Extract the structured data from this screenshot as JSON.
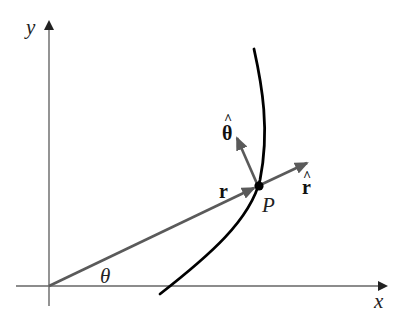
{
  "diagram": {
    "labels": {
      "y_axis": "y",
      "x_axis": "x",
      "angle": "θ",
      "position_vector": "r",
      "point": "P",
      "unit_r": "r",
      "unit_theta": "θ",
      "hat": "^"
    },
    "colors": {
      "axis": "#666666",
      "vector": "#5a5a5a",
      "curve": "#000000",
      "point": "#000000"
    },
    "geometry": {
      "origin": [
        49,
        286
      ],
      "point_P": [
        258,
        186
      ]
    }
  }
}
